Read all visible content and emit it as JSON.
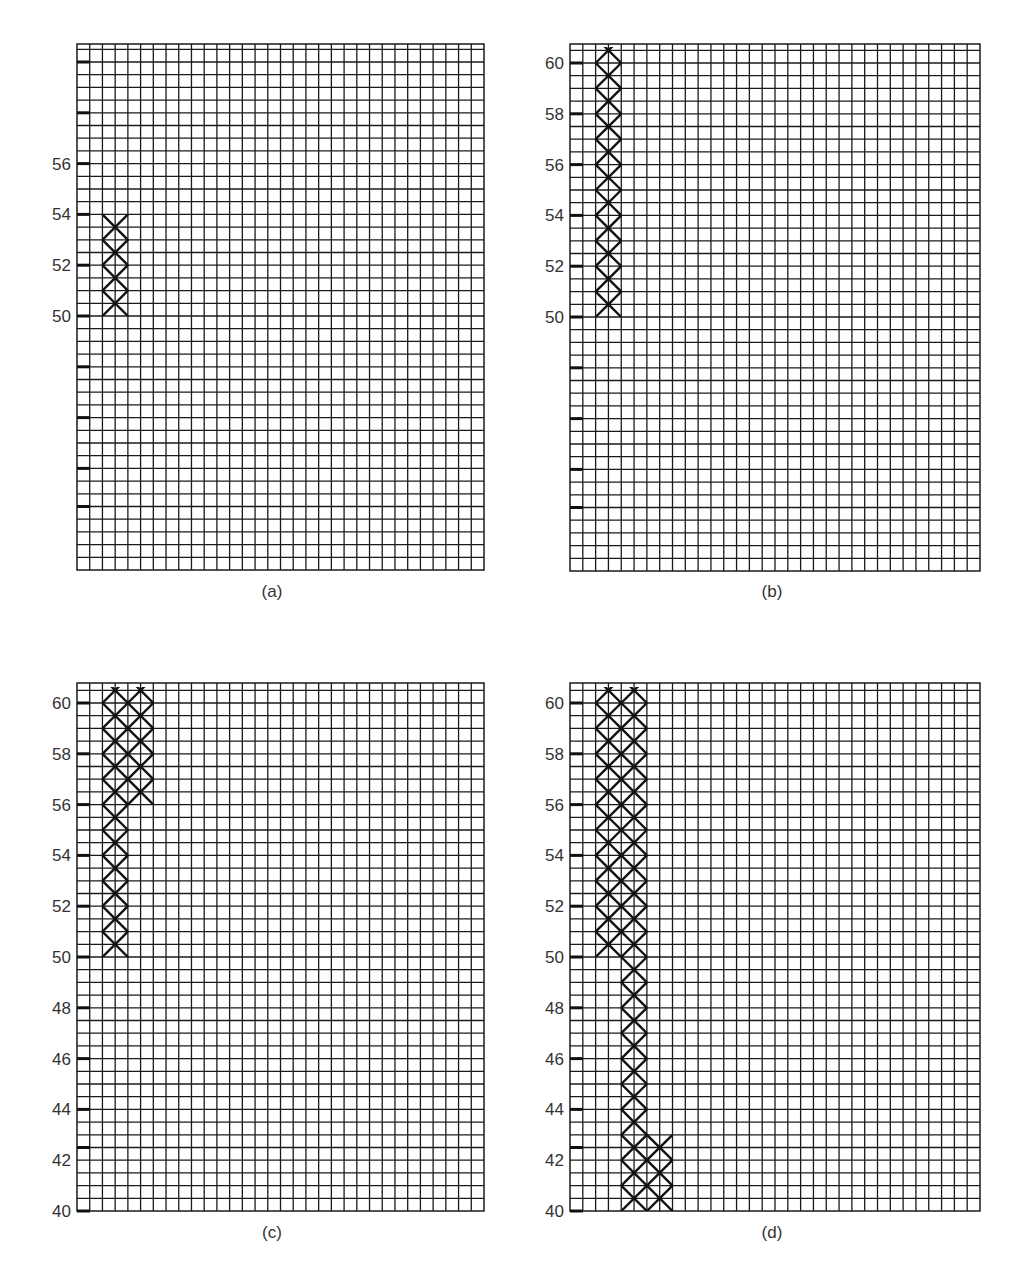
{
  "chart_data": [
    {
      "type": "heatmap",
      "panel": "a",
      "caption": "(a)",
      "grid": {
        "columns": 32,
        "row_unit": 0.5,
        "y_min": 40,
        "y_top": 60.63
      },
      "y_ticks": [
        42.5,
        44,
        46,
        48,
        50,
        52,
        54,
        56,
        58,
        60
      ],
      "y_tick_labels": [
        "",
        "",
        "",
        "",
        "50",
        "52",
        "54",
        "56",
        "",
        ""
      ],
      "lattices": [
        {
          "col_start": 2,
          "col_span": 2,
          "y_from": 50,
          "y_to": 54
        }
      ]
    },
    {
      "type": "heatmap",
      "panel": "b",
      "caption": "(b)",
      "grid": {
        "columns": 32,
        "row_unit": 0.5,
        "y_min": 40,
        "y_top": 60.63
      },
      "y_ticks": [
        42.5,
        44,
        46,
        48,
        50,
        52,
        54,
        56,
        58,
        60
      ],
      "y_tick_labels": [
        "",
        "",
        "",
        "",
        "50",
        "52",
        "54",
        "56",
        "58",
        "60"
      ],
      "lattices": [
        {
          "col_start": 2,
          "col_span": 2,
          "y_from": 50,
          "y_to": 60.63
        }
      ]
    },
    {
      "type": "heatmap",
      "panel": "c",
      "caption": "(c)",
      "grid": {
        "columns": 32,
        "row_unit": 0.5,
        "y_min": 40,
        "y_top": 60.63
      },
      "y_ticks": [
        40,
        42.5,
        44,
        46,
        48,
        50,
        52,
        54,
        56,
        58,
        60
      ],
      "y_tick_labels": [
        "40",
        "42",
        "44",
        "46",
        "48",
        "50",
        "52",
        "54",
        "56",
        "58",
        "60"
      ],
      "y_label_values": [
        40,
        42,
        44,
        46,
        48,
        50,
        52,
        54,
        56,
        58,
        60
      ],
      "lattices": [
        {
          "col_start": 2,
          "col_span": 2,
          "y_from": 50,
          "y_to": 60.63
        },
        {
          "col_start": 4,
          "col_span": 2,
          "y_from": 56,
          "y_to": 60.63
        }
      ]
    },
    {
      "type": "heatmap",
      "panel": "d",
      "caption": "(d)",
      "grid": {
        "columns": 32,
        "row_unit": 0.5,
        "y_min": 40,
        "y_top": 60.63
      },
      "y_ticks": [
        40,
        42.5,
        44,
        46,
        48,
        50,
        52,
        54,
        56,
        58,
        60
      ],
      "y_tick_labels": [
        "40",
        "42",
        "44",
        "46",
        "48",
        "50",
        "52",
        "54",
        "56",
        "58",
        "60"
      ],
      "y_label_values": [
        40,
        42,
        44,
        46,
        48,
        50,
        52,
        54,
        56,
        58,
        60
      ],
      "lattices": [
        {
          "col_start": 2,
          "col_span": 2,
          "y_from": 50,
          "y_to": 60.63
        },
        {
          "col_start": 4,
          "col_span": 2,
          "y_from": 40,
          "y_to": 60.63
        },
        {
          "col_start": 6,
          "col_span": 2,
          "y_from": 40,
          "y_to": 43
        }
      ]
    }
  ],
  "panels": {
    "a": {
      "caption": "(a)"
    },
    "b": {
      "caption": "(b)"
    },
    "c": {
      "caption": "(c)"
    },
    "d": {
      "caption": "(d)"
    }
  }
}
